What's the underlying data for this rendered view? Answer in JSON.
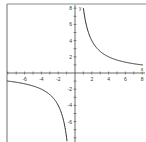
{
  "chart_data": {
    "type": "line",
    "title": "",
    "xlabel": "x",
    "ylabel": "y",
    "xlim": [
      -8.5,
      8
    ],
    "ylim": [
      -8,
      8
    ],
    "grid": false,
    "function": "y = 8/x",
    "x_tick_labels": [
      "-6",
      "-4",
      "-2",
      "2",
      "4",
      "6",
      "8"
    ],
    "x_tick_values": [
      -6,
      -4,
      -2,
      2,
      4,
      6,
      8
    ],
    "y_tick_labels": [
      "8",
      "6",
      "4",
      "2",
      "-2",
      "-4",
      "-6"
    ],
    "y_tick_values": [
      8,
      6,
      4,
      2,
      -2,
      -4,
      -6
    ],
    "series": [
      {
        "name": "y = 8/x (x > 0)",
        "x": [
          1,
          1.5,
          2,
          3,
          4,
          5,
          6,
          7,
          8
        ],
        "y": [
          8,
          5.33,
          4,
          2.67,
          2,
          1.6,
          1.33,
          1.14,
          1
        ]
      },
      {
        "name": "y = 8/x (x < 0)",
        "x": [
          -8.5,
          -8,
          -7,
          -6,
          -5,
          -4,
          -3,
          -2,
          -1.5,
          -1.1
        ],
        "y": [
          -0.94,
          -1,
          -1.14,
          -1.33,
          -1.6,
          -2,
          -2.67,
          -4,
          -5.33,
          -7.27
        ]
      }
    ],
    "colors": {
      "curve": "#333333",
      "axes": "#444444",
      "frame": "#888888"
    }
  }
}
